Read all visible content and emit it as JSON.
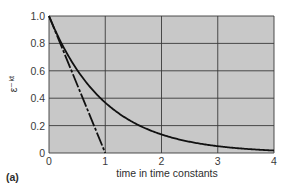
{
  "chart_data": {
    "type": "line",
    "title": "",
    "panel_label": "(a)",
    "xlabel": "time in time constants",
    "ylabel": "ε⁻ᵏᵗ",
    "xlim": [
      0,
      4
    ],
    "ylim": [
      0,
      1.0
    ],
    "x_ticks": [
      "0",
      "1",
      "2",
      "3",
      "4"
    ],
    "y_ticks": [
      "0",
      "0.2",
      "0.4",
      "0.6",
      "0.8",
      "1.0"
    ],
    "grid": true,
    "legend": null,
    "series": [
      {
        "name": "exponential decay e^-kt",
        "style": "solid",
        "x": [
          0,
          0.25,
          0.5,
          0.75,
          1,
          1.5,
          2,
          2.5,
          3,
          3.5,
          4
        ],
        "y": [
          1.0,
          0.78,
          0.61,
          0.47,
          0.37,
          0.22,
          0.14,
          0.08,
          0.05,
          0.03,
          0.02
        ]
      },
      {
        "name": "initial tangent",
        "style": "dash-dot",
        "x": [
          0,
          1
        ],
        "y": [
          1.0,
          0
        ]
      }
    ],
    "colors": {
      "plot_background": "#c8c8c8",
      "grid": "#3a3a3a",
      "line": "#111111"
    }
  }
}
